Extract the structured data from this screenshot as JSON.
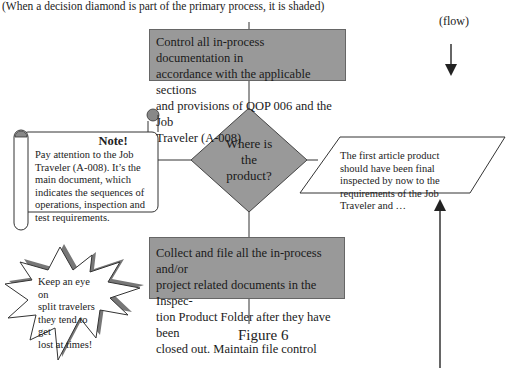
{
  "caption": "(When a decision diamond is part of the primary process, it is shaded)",
  "flow_label": "(flow)",
  "process_top": {
    "lines": [
      "Control all in-process documentation in",
      "accordance with the applicable sections",
      "and provisions of QOP 006 and the Job",
      "Traveler (A-008)"
    ]
  },
  "decision": {
    "lines": [
      "Where is",
      "the",
      "product?"
    ]
  },
  "note": {
    "title": "Note!",
    "lines": [
      "Pay attention to the Job",
      "Traveler  (A-008). It’s the",
      "main document, which",
      "indicates the sequences of",
      "operations, inspection and",
      "test requirements."
    ]
  },
  "data_box": {
    "lines": [
      "The first article product",
      "should have been final",
      "inspected by now to the",
      "requirements of the Job",
      "Traveler and …"
    ]
  },
  "process_bottom": {
    "lines": [
      "Collect and file all the in-process and/or",
      "project related documents in the Inspec-",
      "tion Product Folder after they have been",
      "closed out. Maintain file control"
    ]
  },
  "callout_star": {
    "lines": [
      "Keep an eye on",
      "split travelers",
      "they tend to get",
      "lost at times!"
    ]
  },
  "figure_label": "Figure 6",
  "colors": {
    "shaded_fill": "#999999",
    "stroke": "#333333",
    "background": "#ffffff"
  }
}
